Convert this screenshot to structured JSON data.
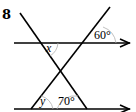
{
  "question": {
    "number": "8"
  },
  "diagram": {
    "type": "parallel-lines-transversals",
    "angles": [
      {
        "label": "x",
        "position": "top-line, between transversals, right of descending line"
      },
      {
        "label": "60°",
        "position": "top-line, right of ascending line, above"
      },
      {
        "label": "y",
        "position": "bottom-line, right of ascending line"
      },
      {
        "label": "70°",
        "position": "bottom-line, inside triangle between transversals"
      }
    ],
    "colors": {
      "line": "#000000",
      "arc": "#b0b0b0"
    }
  }
}
